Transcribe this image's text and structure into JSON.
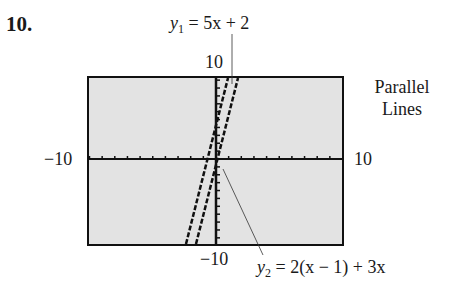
{
  "problem_number": "10.",
  "side_label": {
    "line1": "Parallel",
    "line2": "Lines"
  },
  "window": {
    "xmin_label": "−10",
    "xmax_label": "10",
    "ymin_label": "−10",
    "ymax_label": "10"
  },
  "equations": {
    "y1": {
      "var": "y",
      "sub": "1",
      "rhs": " = 5x + 2"
    },
    "y2": {
      "var": "y",
      "sub": "2",
      "rhs": " = 2(x − 1) + 3x"
    }
  },
  "colors": {
    "screen_bg": "#e3e3e3",
    "ink": "#111111"
  },
  "chart_data": {
    "type": "line",
    "title": "Parallel Lines",
    "xlabel": "",
    "ylabel": "",
    "xlim": [
      -10,
      10
    ],
    "ylim": [
      -10,
      10
    ],
    "xscale_ticks": 1,
    "yscale_ticks": 1,
    "grid": false,
    "series": [
      {
        "name": "y1 = 5x + 2",
        "slope": 5,
        "intercept": 2,
        "points": [
          [
            -2.4,
            -10
          ],
          [
            1.6,
            10
          ]
        ]
      },
      {
        "name": "y2 = 2(x − 1) + 3x",
        "slope": 5,
        "intercept": -2,
        "points": [
          [
            -1.6,
            -10
          ],
          [
            2.4,
            10
          ]
        ]
      }
    ],
    "annotations": [
      "y1 = 5x + 2",
      "y2 = 2(x − 1) + 3x",
      "Parallel Lines"
    ]
  }
}
